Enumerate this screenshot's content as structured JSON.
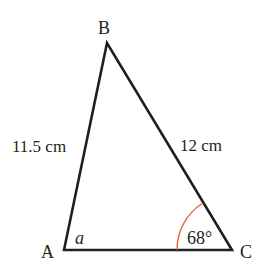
{
  "diagram": {
    "type": "triangle",
    "vertices": {
      "A": {
        "label": "A",
        "x": 64,
        "y": 250
      },
      "B": {
        "label": "B",
        "x": 107,
        "y": 43
      },
      "C": {
        "label": "C",
        "x": 232,
        "y": 250
      }
    },
    "sides": {
      "AB": {
        "label": "11.5 cm"
      },
      "BC": {
        "label": "12 cm"
      }
    },
    "angles": {
      "A": {
        "label": "a"
      },
      "C": {
        "label": "68°"
      }
    },
    "colors": {
      "line": "#231f20",
      "arc": "#e0623a"
    }
  }
}
